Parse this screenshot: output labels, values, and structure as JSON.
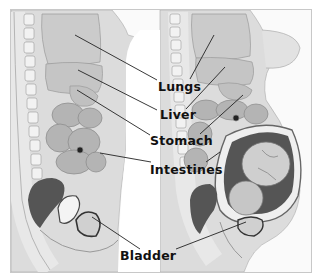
{
  "diagram": {
    "panels": [
      {
        "name": "non-pregnant",
        "position": "left"
      },
      {
        "name": "pregnant",
        "position": "right"
      }
    ],
    "labels": [
      {
        "id": "lungs",
        "text": "Lungs",
        "x": 159,
        "y": 79
      },
      {
        "id": "liver",
        "text": "Liver",
        "x": 162,
        "y": 109
      },
      {
        "id": "stomach",
        "text": "Stomach",
        "x": 152,
        "y": 135
      },
      {
        "id": "intestines",
        "text": "Intestines",
        "x": 151,
        "y": 163
      },
      {
        "id": "bladder",
        "text": "Bladder",
        "x": 120,
        "y": 248
      }
    ],
    "colors": {
      "background": "#fafafa",
      "frame": "#c8c8c8",
      "body": "#d9d9d9",
      "organ": "#bdbdbd",
      "dark": "#555555",
      "line": "#222222",
      "text": "#111111"
    }
  }
}
